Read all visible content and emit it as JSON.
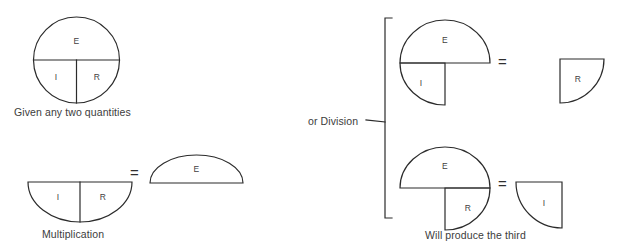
{
  "diagram": {
    "stroke_color": "#2b2b2b",
    "text_color": "#3c3c3c",
    "background": "#ffffff",
    "symbols": {
      "E": "E",
      "I": "I",
      "R": "R",
      "equals": "="
    },
    "captions": {
      "given": "Given any two quantities",
      "multiplication": "Multiplication",
      "or_division": "or Division",
      "will_produce": "Will produce the third"
    },
    "groups": [
      {
        "name": "given-circle",
        "caption": "Given any two quantities",
        "segments": [
          {
            "label": "E",
            "shape": "upper-half"
          },
          {
            "label": "I",
            "shape": "lower-left-quarter"
          },
          {
            "label": "R",
            "shape": "lower-right-quarter"
          }
        ]
      },
      {
        "name": "multiplication",
        "caption": "Multiplication",
        "operator": "=",
        "left": {
          "segments": [
            {
              "label": "I",
              "shape": "lower-left-quarter"
            },
            {
              "label": "R",
              "shape": "lower-right-quarter"
            }
          ]
        },
        "right": {
          "segments": [
            {
              "label": "E",
              "shape": "upper-half"
            }
          ]
        }
      },
      {
        "name": "division-voltage-over-current",
        "caption": "or Division",
        "operator": "=",
        "left": {
          "segments": [
            {
              "label": "E",
              "shape": "upper-half"
            },
            {
              "label": "I",
              "shape": "lower-left-quarter"
            }
          ]
        },
        "right": {
          "segments": [
            {
              "label": "R",
              "shape": "lower-right-quarter"
            }
          ]
        }
      },
      {
        "name": "division-voltage-over-resistance",
        "caption": "Will produce the third",
        "operator": "=",
        "left": {
          "segments": [
            {
              "label": "E",
              "shape": "upper-half"
            },
            {
              "label": "R",
              "shape": "lower-right-quarter"
            }
          ]
        },
        "right": {
          "segments": [
            {
              "label": "I",
              "shape": "lower-left-quarter"
            }
          ]
        }
      }
    ]
  }
}
